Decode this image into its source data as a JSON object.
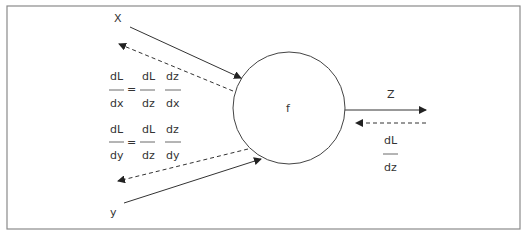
{
  "diagram": {
    "node": {
      "label": "f"
    },
    "inputs": [
      {
        "label": "X"
      },
      {
        "label": "y"
      }
    ],
    "output": {
      "label": "Z"
    },
    "upstream_gradient": {
      "num": "dL",
      "den": "dz"
    },
    "gradient_x": {
      "lhs": {
        "num": "dL",
        "den": "dx"
      },
      "eq": "=",
      "rhs1": {
        "num": "dL",
        "den": "dz"
      },
      "rhs2": {
        "num": "dz",
        "den": "dx"
      }
    },
    "gradient_y": {
      "lhs": {
        "num": "dL",
        "den": "dy"
      },
      "eq": "=",
      "rhs1": {
        "num": "dL",
        "den": "dz"
      },
      "rhs2": {
        "num": "dz",
        "den": "dy"
      }
    },
    "colors": {
      "line": "#333333",
      "border": "#888888"
    }
  }
}
